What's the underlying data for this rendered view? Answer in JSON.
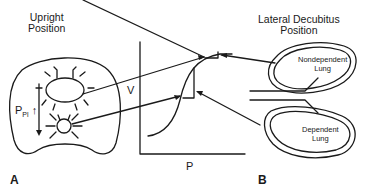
{
  "panel_a": {
    "letter": "A",
    "title_line1": "Upright",
    "title_line2": "Position",
    "pressure_label": "P",
    "pressure_subscript": "Pl",
    "pressure_arrow": "↑"
  },
  "graph": {
    "y_label": "V",
    "x_label": "P"
  },
  "panel_b": {
    "letter": "B",
    "title_line1": "Lateral Decubitus",
    "title_line2": "Position",
    "upper_lung_line1": "Nondependent",
    "upper_lung_line2": "Lung",
    "lower_lung_line1": "Dependent",
    "lower_lung_line2": "Lung"
  },
  "colors": {
    "ink": "#1a1a1a",
    "background": "#ffffff"
  }
}
